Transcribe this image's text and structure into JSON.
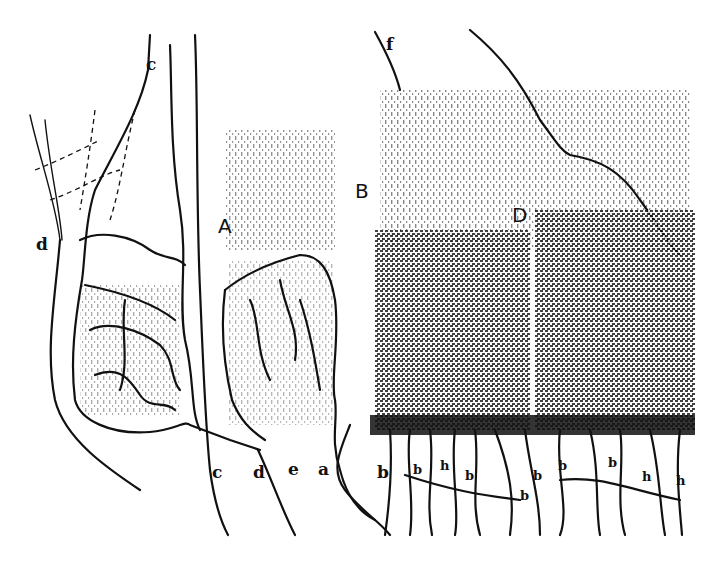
{
  "figure": {
    "labels": {
      "top_c": "c",
      "left_d": "d",
      "region_A": "A",
      "region_B": "B",
      "region_D": "D",
      "top_f": "f",
      "bottom": [
        "c",
        "d",
        "e",
        "a",
        "b",
        "b",
        "h",
        "b",
        "b",
        "b",
        "b",
        "b",
        "h",
        "h"
      ]
    }
  }
}
